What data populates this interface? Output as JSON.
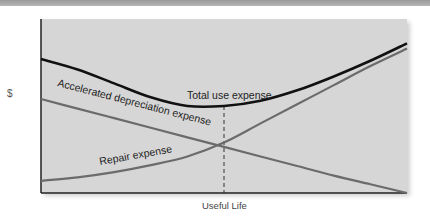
{
  "chart_data": {
    "type": "line",
    "title": "",
    "xlabel": "Useful Life",
    "ylabel": "$",
    "xlim": [
      0,
      1
    ],
    "ylim": [
      0,
      1
    ],
    "grid": false,
    "legend": "inline labels",
    "x": [
      0,
      0.1,
      0.2,
      0.3,
      0.4,
      0.5,
      0.6,
      0.7,
      0.8,
      0.9,
      1.0
    ],
    "series": [
      {
        "name": "Total use expense",
        "color": "#111111",
        "values": [
          0.77,
          0.71,
          0.63,
          0.55,
          0.5,
          0.5,
          0.53,
          0.59,
          0.67,
          0.76,
          0.86
        ]
      },
      {
        "name": "Accelerated depreciation expense",
        "color": "#6b6b6b",
        "values": [
          0.54,
          0.485,
          0.43,
          0.375,
          0.32,
          0.265,
          0.21,
          0.155,
          0.1,
          0.05,
          0.0
        ]
      },
      {
        "name": "Repair expense",
        "color": "#6b6b6b",
        "values": [
          0.07,
          0.09,
          0.12,
          0.16,
          0.21,
          0.29,
          0.4,
          0.51,
          0.62,
          0.73,
          0.83
        ]
      }
    ],
    "annotations": [
      {
        "type": "vertical-dashed-line",
        "x": 0.5,
        "label": "optimal replacement point (minimum total use expense)"
      }
    ]
  },
  "labels": {
    "total": "Total use expense",
    "depreciation": "Accelerated  depreciation  expense",
    "repair": "Repair  expense"
  }
}
